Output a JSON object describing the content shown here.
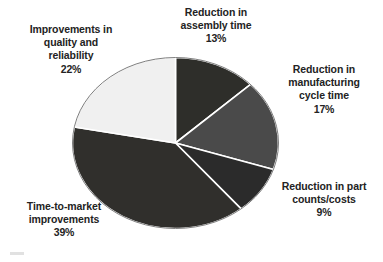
{
  "chart_data": {
    "type": "pie",
    "title": "",
    "subtitle": "",
    "xlabel": "",
    "ylabel": "",
    "legend_position": "none",
    "grid": false,
    "labels_on_slices": false,
    "total_percent": 100,
    "categories": [
      "Reduction in assembly time",
      "Reduction in manufacturing cycle time",
      "Reduction in part counts/costs",
      "Time-to-market improvements",
      "Improvements in quality and reliability"
    ],
    "values": [
      13,
      17,
      9,
      39,
      22
    ],
    "value_labels": [
      "13%",
      "17%",
      "9%",
      "39%",
      "22%"
    ],
    "colors": [
      "#2e2e2a",
      "#4a4a4a",
      "#2b2b2b",
      "#302f2c",
      "#f0f0f0"
    ],
    "slice_border_color": "#ffffff",
    "start_angle_deg": 0,
    "direction": "clockwise",
    "slices": [
      {
        "name": "assembly-time",
        "value": 13,
        "value_label": "13%",
        "color": "#2e2e2a",
        "label_lines": [
          "Reduction in",
          "assembly time"
        ]
      },
      {
        "name": "manufacturing-cycle-time",
        "value": 17,
        "value_label": "17%",
        "color": "#4a4a4a",
        "label_lines": [
          "Reduction in",
          "manufacturing",
          "cycle time"
        ]
      },
      {
        "name": "part-counts-costs",
        "value": 9,
        "value_label": "9%",
        "color": "#2b2b2b",
        "label_lines": [
          "Reduction in part",
          "counts/costs"
        ]
      },
      {
        "name": "time-to-market",
        "value": 39,
        "value_label": "39%",
        "color": "#302f2c",
        "label_lines": [
          "Time-to-market",
          "improvements"
        ]
      },
      {
        "name": "quality-reliability",
        "value": 22,
        "value_label": "22%",
        "color": "#f0f0f0",
        "label_lines": [
          "Improvements in",
          "quality and",
          "reliability"
        ]
      }
    ]
  },
  "labels": {
    "assembly": {
      "line1": "Reduction in",
      "line2": "assembly time",
      "percent": "13%"
    },
    "quality": {
      "line1": "Improvements in",
      "line2": "quality and",
      "line3": "reliability",
      "percent": "22%"
    },
    "cycle": {
      "line1": "Reduction in",
      "line2": "manufacturing",
      "line3": "cycle time",
      "percent": "17%"
    },
    "parts": {
      "line1": "Reduction in part",
      "line2": "counts/costs",
      "percent": "9%"
    },
    "ttm": {
      "line1": "Time-to-market",
      "line2": "improvements",
      "percent": "39%"
    }
  }
}
